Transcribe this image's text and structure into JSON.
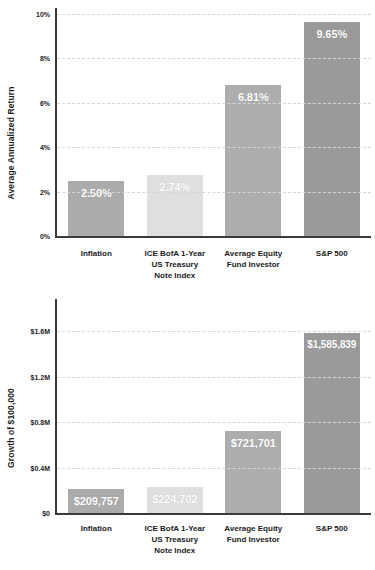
{
  "chart_data": [
    {
      "id": "top",
      "type": "bar",
      "title": "",
      "xlabel": "",
      "ylabel": "Average Annualized Return",
      "categories": [
        "Inflation",
        "ICE BofA 1-Year US Treasury Note Index",
        "Average Equity Fund Investor",
        "S&P 500"
      ],
      "category_lines": [
        [
          "Inflation"
        ],
        [
          "ICE BofA 1-Year",
          "US Treasury",
          "Note Index"
        ],
        [
          "Average Equity",
          "Fund Investor"
        ],
        [
          "S&P 500"
        ]
      ],
      "values": [
        2.5,
        2.74,
        6.81,
        9.65
      ],
      "value_labels": [
        "2.50%",
        "2.74%",
        "6.81%",
        "9.65%"
      ],
      "bar_colors": [
        "#ababab",
        "#dfdfdf",
        "#adadad",
        "#9a9a9a"
      ],
      "ylim": [
        0,
        10
      ],
      "yticks": [
        0,
        2,
        4,
        6,
        8,
        10
      ],
      "ytick_labels": [
        "0%",
        "2%",
        "4%",
        "6%",
        "8%",
        "10%"
      ],
      "grid": true,
      "legend": "none"
    },
    {
      "id": "bottom",
      "type": "bar",
      "title": "",
      "xlabel": "",
      "ylabel": "Growth of $100,000",
      "categories": [
        "Inflation",
        "ICE BofA 1-Year US Treasury Note Index",
        "Average Equity Fund Investor",
        "S&P 500"
      ],
      "category_lines": [
        [
          "Inflation"
        ],
        [
          "ICE BofA 1-Year",
          "US Treasury",
          "Note Index"
        ],
        [
          "Average Equity",
          "Fund Investor"
        ],
        [
          "S&P 500"
        ]
      ],
      "values": [
        209757,
        224702,
        721701,
        1585839
      ],
      "value_labels": [
        "$209,757",
        "$224,702",
        "$721,701",
        "$1,585,839"
      ],
      "bar_colors": [
        "#ababab",
        "#dfdfdf",
        "#adadad",
        "#9a9a9a"
      ],
      "ylim": [
        0,
        1760000
      ],
      "yticks": [
        0,
        400000,
        800000,
        1200000,
        1600000
      ],
      "ytick_labels": [
        "$0",
        "$0.4M",
        "$0.8M",
        "$1.2M",
        "$1.6M"
      ],
      "grid": true,
      "legend": "none"
    }
  ],
  "colors": {
    "background": "#ffffff",
    "axis": "#3a3a3a",
    "gridline": "#d6d6d6",
    "text": "#1c1c1c",
    "value_text": "#ffffff"
  }
}
